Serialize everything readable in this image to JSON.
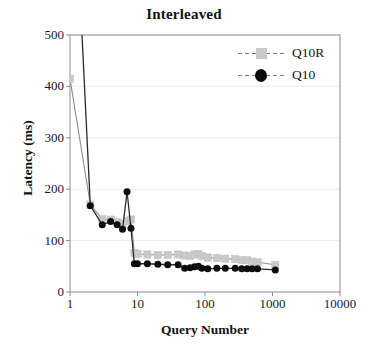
{
  "chart_data": {
    "type": "line",
    "title": "Interleaved",
    "xlabel": "Query Number",
    "ylabel": "Latency (ms)",
    "xscale": "log",
    "xlim": [
      1,
      10000
    ],
    "ylim": [
      0,
      500
    ],
    "xticks": [
      "1",
      "10",
      "100",
      "1000",
      "10000"
    ],
    "xtick_values": [
      1,
      10,
      100,
      1000,
      10000
    ],
    "yticks": [
      "0",
      "100",
      "200",
      "300",
      "400",
      "500"
    ],
    "ytick_values": [
      0,
      100,
      200,
      300,
      400,
      500
    ],
    "grid": "horizontal",
    "legend_position": "top-right",
    "series": [
      {
        "name": "Q10R",
        "color": "#c9c9c9",
        "marker": "square",
        "line_style": "solid-thin-gray",
        "x": [
          1,
          2,
          3,
          4,
          5,
          6,
          7,
          8,
          9,
          10,
          14,
          20,
          28,
          40,
          50,
          60,
          70,
          80,
          90,
          110,
          150,
          200,
          280,
          350,
          420,
          500,
          600,
          1100
        ],
        "y": [
          415,
          170,
          142,
          141,
          136,
          133,
          138,
          141,
          76,
          74,
          73,
          72,
          72,
          73,
          71,
          70,
          73,
          74,
          70,
          67,
          66,
          65,
          64,
          62,
          62,
          59,
          58,
          53
        ]
      },
      {
        "name": "Q10",
        "color": "#0d0d0d",
        "marker": "circle",
        "line_style": "solid-thin-dark",
        "x": [
          1,
          2,
          3,
          4,
          5,
          6,
          7,
          8,
          9,
          10,
          14,
          20,
          28,
          40,
          50,
          60,
          70,
          80,
          90,
          110,
          150,
          200,
          280,
          350,
          420,
          500,
          600,
          1100
        ],
        "y": [
          980,
          168,
          131,
          137,
          131,
          122,
          195,
          124,
          55,
          55,
          55,
          54,
          53,
          53,
          46,
          47,
          49,
          50,
          46,
          45,
          46,
          46,
          46,
          45,
          45,
          45,
          45,
          43
        ],
        "note_clipped": "First point at query 1 lies above the plotted range (>500 ms); line enters the axis area from the top."
      }
    ],
    "annotations": [
      {
        "text": "Q10 spike",
        "x": 7,
        "y": 195
      }
    ]
  },
  "legend": {
    "entries": [
      {
        "label": "Q10R",
        "marker": "square-gray"
      },
      {
        "label": "Q10",
        "marker": "circle-black"
      }
    ]
  },
  "colors": {
    "q10r": "#c9c9c9",
    "q10": "#0d0d0d",
    "axis": "#8c8c8c",
    "grid": "#ededed",
    "text": "#141414",
    "background": "#ffffff"
  }
}
